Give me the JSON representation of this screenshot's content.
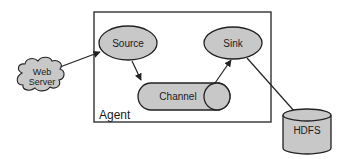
{
  "diagram": {
    "type": "architecture",
    "colors": {
      "node_fill": "#c8c8c8",
      "stroke": "#222222",
      "background": "#ffffff"
    },
    "container": {
      "id": "agent",
      "label": "Agent"
    },
    "nodes": [
      {
        "id": "web_server",
        "label_line1": "Web",
        "label_line2": "Server",
        "shape": "cloud"
      },
      {
        "id": "source",
        "label": "Source",
        "shape": "ellipse"
      },
      {
        "id": "channel",
        "label": "Channel",
        "shape": "horizontal-cylinder"
      },
      {
        "id": "sink",
        "label": "Sink",
        "shape": "ellipse"
      },
      {
        "id": "hdfs",
        "label": "HDFS",
        "shape": "cylinder"
      }
    ],
    "edges": [
      {
        "from": "web_server",
        "to": "source"
      },
      {
        "from": "source",
        "to": "channel"
      },
      {
        "from": "channel",
        "to": "sink"
      },
      {
        "from": "sink",
        "to": "hdfs"
      }
    ]
  }
}
